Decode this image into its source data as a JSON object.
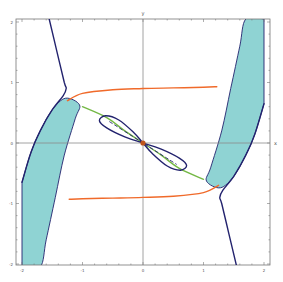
{
  "chart_data": {
    "type": "line",
    "title": "",
    "xlabel": "x",
    "ylabel": "y",
    "xlim": [
      -2.1,
      2.1
    ],
    "ylim": [
      -2.05,
      2.05
    ],
    "grid": false,
    "legend": null,
    "x_ticks": [
      "-2",
      "-1",
      "0",
      "1",
      "2"
    ],
    "y_ticks": [
      "2",
      "1",
      "0",
      "-1",
      "-2"
    ],
    "colors": {
      "frame": "#777777",
      "axes": "#8a8a8a",
      "navy_curve": "#23236e",
      "orange_curve": "#f06a2a",
      "green_curve": "#74b845",
      "shaded_region": "#8fd3d3",
      "origin_point": "#c0541c"
    },
    "series": [
      {
        "name": "navy-curve-left",
        "color": "#23236e",
        "points": [
          [
            -1.55,
            2.05
          ],
          [
            -1.42,
            1.5
          ],
          [
            -1.3,
            1.0
          ],
          [
            -1.27,
            0.9
          ],
          [
            -1.32,
            0.78
          ],
          [
            -1.5,
            0.55
          ],
          [
            -1.7,
            0.2
          ],
          [
            -1.85,
            -0.15
          ],
          [
            -2.0,
            -0.65
          ]
        ]
      },
      {
        "name": "navy-curve-right",
        "color": "#23236e",
        "points": [
          [
            2.0,
            0.65
          ],
          [
            1.85,
            0.15
          ],
          [
            1.7,
            -0.2
          ],
          [
            1.5,
            -0.55
          ],
          [
            1.32,
            -0.78
          ],
          [
            1.27,
            -0.9
          ],
          [
            1.3,
            -1.0
          ],
          [
            1.42,
            -1.5
          ],
          [
            1.55,
            -2.05
          ]
        ]
      },
      {
        "name": "orange-curve-upper",
        "color": "#f06a2a",
        "points": [
          [
            -1.25,
            0.7
          ],
          [
            -1.0,
            0.82
          ],
          [
            -0.5,
            0.88
          ],
          [
            0.0,
            0.9
          ],
          [
            0.5,
            0.91
          ],
          [
            1.0,
            0.92
          ],
          [
            1.22,
            0.93
          ]
        ]
      },
      {
        "name": "orange-curve-lower",
        "color": "#f06a2a",
        "points": [
          [
            -1.22,
            -0.93
          ],
          [
            -1.0,
            -0.92
          ],
          [
            -0.5,
            -0.91
          ],
          [
            0.0,
            -0.9
          ],
          [
            0.5,
            -0.88
          ],
          [
            1.0,
            -0.82
          ],
          [
            1.25,
            -0.7
          ]
        ]
      },
      {
        "name": "green-curve",
        "color": "#74b845",
        "points": [
          [
            -1.0,
            0.6
          ],
          [
            -0.6,
            0.42
          ],
          [
            -0.3,
            0.2
          ],
          [
            0.0,
            0.0
          ],
          [
            0.3,
            -0.2
          ],
          [
            0.6,
            -0.42
          ],
          [
            1.0,
            -0.6
          ]
        ]
      },
      {
        "name": "navy-loop",
        "color": "#23236e",
        "type": "closed-loop",
        "points": [
          [
            0.0,
            0.0
          ],
          [
            -0.3,
            0.1
          ],
          [
            -0.6,
            0.25
          ],
          [
            -0.72,
            0.37
          ],
          [
            -0.62,
            0.45
          ],
          [
            -0.4,
            0.38
          ],
          [
            -0.15,
            0.17
          ],
          [
            0.0,
            0.0
          ],
          [
            0.15,
            -0.17
          ],
          [
            0.4,
            -0.38
          ],
          [
            0.62,
            -0.45
          ],
          [
            0.72,
            -0.37
          ],
          [
            0.6,
            -0.25
          ],
          [
            0.3,
            -0.1
          ],
          [
            0.0,
            0.0
          ]
        ]
      },
      {
        "name": "dashed-inner-line",
        "color": "#23236e",
        "style": "dashed",
        "points": [
          [
            -0.55,
            0.35
          ],
          [
            0.0,
            0.0
          ],
          [
            0.55,
            -0.35
          ]
        ]
      },
      {
        "name": "shaded-band-left",
        "color": "#8fd3d3",
        "type": "area",
        "points": [
          [
            -2.0,
            -0.65
          ],
          [
            -1.85,
            -0.15
          ],
          [
            -1.7,
            0.2
          ],
          [
            -1.5,
            0.55
          ],
          [
            -1.28,
            0.74
          ],
          [
            -1.05,
            0.63
          ],
          [
            -1.12,
            0.4
          ],
          [
            -1.3,
            -0.2
          ],
          [
            -1.45,
            -0.9
          ],
          [
            -1.6,
            -1.6
          ],
          [
            -1.7,
            -2.05
          ],
          [
            -2.0,
            -2.05
          ]
        ]
      },
      {
        "name": "shaded-band-right",
        "color": "#8fd3d3",
        "type": "area",
        "points": [
          [
            2.0,
            0.65
          ],
          [
            1.85,
            0.15
          ],
          [
            1.7,
            -0.2
          ],
          [
            1.5,
            -0.55
          ],
          [
            1.28,
            -0.74
          ],
          [
            1.05,
            -0.63
          ],
          [
            1.12,
            -0.4
          ],
          [
            1.3,
            0.2
          ],
          [
            1.45,
            0.9
          ],
          [
            1.6,
            1.6
          ],
          [
            1.7,
            2.05
          ],
          [
            2.0,
            2.05
          ]
        ]
      }
    ],
    "annotations": [
      {
        "type": "point",
        "x": 0,
        "y": 0,
        "color": "#c0541c"
      }
    ]
  }
}
